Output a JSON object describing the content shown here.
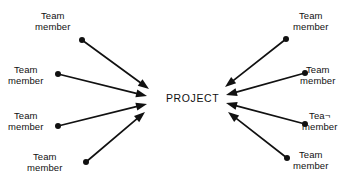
{
  "diagram": {
    "title_node": {
      "label": "PROJECT",
      "x": 166,
      "y": 92
    },
    "background_color": "#ffffff",
    "stroke_color": "#111111",
    "nodes": [
      {
        "id": "left-1",
        "line1": "Team",
        "line2": "member",
        "label_x": 35,
        "label_y": 10,
        "dot_x": 82,
        "dot_y": 40,
        "arrow_tip_x": 149,
        "arrow_tip_y": 89,
        "side": "left"
      },
      {
        "id": "left-2",
        "line1": "Team",
        "line2": "member",
        "label_x": 8,
        "label_y": 64,
        "dot_x": 58,
        "dot_y": 74,
        "arrow_tip_x": 147,
        "arrow_tip_y": 96,
        "side": "left"
      },
      {
        "id": "left-3",
        "line1": "Team",
        "line2": "member",
        "label_x": 8,
        "label_y": 110,
        "dot_x": 58,
        "dot_y": 126,
        "arrow_tip_x": 147,
        "arrow_tip_y": 104,
        "side": "left"
      },
      {
        "id": "left-4",
        "line1": "Team",
        "line2": "member",
        "label_x": 27,
        "label_y": 151,
        "dot_x": 86,
        "dot_y": 162,
        "arrow_tip_x": 145,
        "arrow_tip_y": 112,
        "side": "left"
      },
      {
        "id": "right-1",
        "line1": "Team",
        "line2": "member",
        "label_x": 293,
        "label_y": 10,
        "dot_x": 286,
        "dot_y": 39,
        "arrow_tip_x": 225,
        "arrow_tip_y": 87,
        "side": "right"
      },
      {
        "id": "right-2",
        "line1": "Team",
        "line2": "member",
        "label_x": 300,
        "label_y": 64,
        "dot_x": 305,
        "dot_y": 73,
        "arrow_tip_x": 226,
        "arrow_tip_y": 95,
        "side": "right"
      },
      {
        "id": "right-3",
        "line1": "Tea¬",
        "line2": "member",
        "label_x": 302,
        "label_y": 110,
        "dot_x": 305,
        "dot_y": 124,
        "arrow_tip_x": 226,
        "arrow_tip_y": 103,
        "side": "right"
      },
      {
        "id": "right-4",
        "line1": "Team",
        "line2": "member",
        "label_x": 293,
        "label_y": 149,
        "dot_x": 287,
        "dot_y": 158,
        "arrow_tip_x": 228,
        "arrow_tip_y": 112,
        "side": "right"
      }
    ]
  }
}
